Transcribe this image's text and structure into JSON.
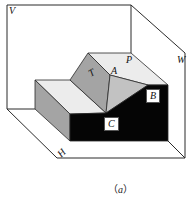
{
  "figure": {
    "caption_open": "（",
    "caption_letter": "a",
    "caption_close": "）",
    "colors": {
      "stroke": "#2a2a2a",
      "black_face": "#050505",
      "dark_grey_face": "#a4a4a4",
      "light_grey_face": "#c2c2c2",
      "light_face": "#ececec",
      "plane": "#ffffff"
    },
    "planes": {
      "V": "V",
      "W": "W",
      "H": "H",
      "P": "P"
    },
    "faces": {
      "T": "T",
      "A": "A",
      "B": "B",
      "C": "C"
    }
  }
}
